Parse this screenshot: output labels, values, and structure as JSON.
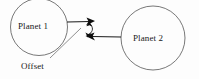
{
  "diagram": {
    "background_color": "#fdfdfd",
    "stroke_color": "#555555",
    "arrow_color": "#111111",
    "text_color": "#181818",
    "nodes": [
      {
        "id": "planet1",
        "label": "Planet 1",
        "shape": "circle",
        "cx": 39,
        "cy": 27,
        "r": 28.5
      },
      {
        "id": "planet2",
        "label": "Planet 2",
        "shape": "circle",
        "cx": 153,
        "cy": 38,
        "r": 32
      }
    ],
    "annotations": [
      {
        "id": "offset",
        "label": "Offset",
        "leader_from_x": 50,
        "leader_from_y": 58,
        "leader_to_x": 81,
        "leader_to_y": 28
      }
    ],
    "connectors": [
      {
        "id": "planet1-to-point",
        "from": "planet1",
        "to": "upper-point",
        "arrowhead": "end",
        "x1": 67,
        "y1": 22,
        "x2": 94,
        "y2": 21
      },
      {
        "id": "planet2-to-point",
        "from": "planet2",
        "to": "lower-point",
        "arrowhead": "end",
        "x1": 121,
        "y1": 37,
        "x2": 89,
        "y2": 36
      },
      {
        "id": "offset-gap-measure",
        "from": "upper-point",
        "to": "lower-point",
        "arrowhead": "both",
        "x1": 89,
        "y1": 23,
        "x2": 88,
        "y2": 35
      }
    ]
  }
}
